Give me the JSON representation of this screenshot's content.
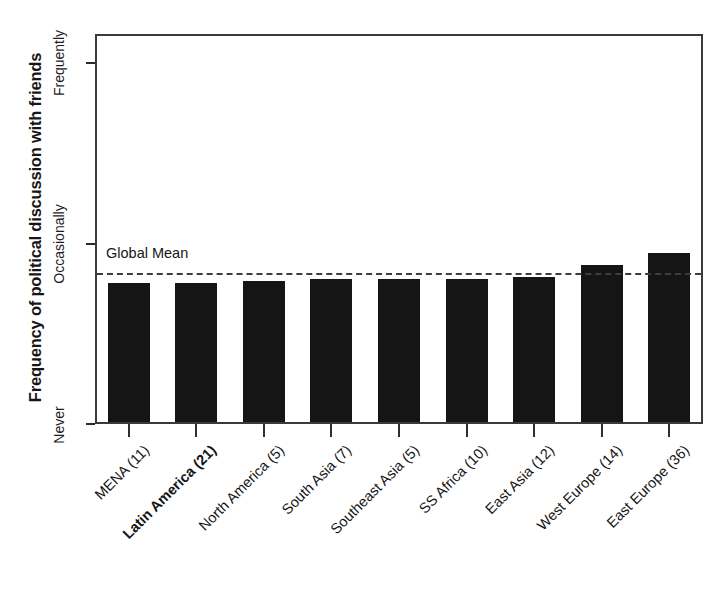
{
  "chart_data": {
    "type": "bar",
    "title": "",
    "xlabel": "",
    "ylabel": "Frequency of political discussion with friends",
    "categories": [
      "MENA (11)",
      "Latin America (21)",
      "North America (5)",
      "South Asia (7)",
      "Southeast Asia (5)",
      "SS Africa (10)",
      "East Asia (12)",
      "West Europe (14)",
      "East Europe (36)"
    ],
    "values": [
      1.385,
      1.385,
      1.4,
      1.415,
      1.415,
      1.415,
      1.43,
      1.47,
      1.53
    ],
    "bar_top_px": [
      285,
      285,
      283,
      281,
      281,
      281,
      279,
      267,
      255
    ],
    "highlighted_category": "Latin America (21)",
    "ytick_labels": [
      "Never",
      "Occasionally",
      "Frequently"
    ],
    "ytick_px": [
      424,
      243,
      62
    ],
    "ylim": [
      1,
      3
    ],
    "grid": false,
    "legend": "none",
    "annotations": [
      {
        "name": "global-mean",
        "label": "Global Mean",
        "value": 1.445,
        "style": "dashed-horizontal-line",
        "y_px": 272
      }
    ],
    "bar_color": "#151515",
    "frame_color": "#3a3a3a",
    "background": "#ffffff"
  },
  "axes": {
    "y_title": "Frequency of political discussion with friends",
    "y_ticks": [
      {
        "label": "Frequently"
      },
      {
        "label": "Occasionally"
      },
      {
        "label": "Never"
      }
    ]
  },
  "annotation": {
    "global_mean_label": "Global Mean"
  }
}
